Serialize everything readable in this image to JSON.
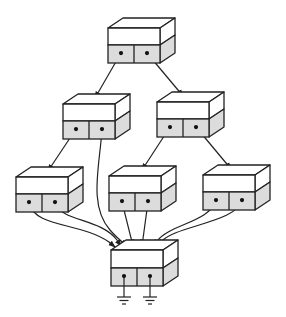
{
  "diagram": {
    "colors": {
      "stroke": "#222222",
      "port_fill": "#dcdcdc",
      "box_fill": "#ffffff"
    },
    "depth": {
      "dx": 15,
      "dy": -10
    },
    "nodes": [
      {
        "id": "root",
        "x": 108,
        "y": 28,
        "w": 52,
        "upper_h": 17,
        "lower_h": 18
      },
      {
        "id": "mid-left",
        "x": 63,
        "y": 104,
        "w": 52,
        "upper_h": 17,
        "lower_h": 18
      },
      {
        "id": "mid-right",
        "x": 157,
        "y": 102,
        "w": 52,
        "upper_h": 17,
        "lower_h": 18
      },
      {
        "id": "leaf-left",
        "x": 16,
        "y": 177,
        "w": 52,
        "upper_h": 17,
        "lower_h": 18
      },
      {
        "id": "leaf-middle",
        "x": 109,
        "y": 176,
        "w": 52,
        "upper_h": 17,
        "lower_h": 18
      },
      {
        "id": "leaf-right",
        "x": 203,
        "y": 175,
        "w": 52,
        "upper_h": 17,
        "lower_h": 18
      },
      {
        "id": "sink",
        "x": 111,
        "y": 250,
        "w": 52,
        "upper_h": 18,
        "lower_h": 18
      }
    ],
    "edges": [
      {
        "from": "root.p0",
        "to": "mid-left.top",
        "d": "M121,53 L95,98"
      },
      {
        "from": "root.p1",
        "to": "mid-right.top",
        "d": "M147,53 L183,96"
      },
      {
        "from": "mid-left.p0",
        "to": "leaf-left.top",
        "d": "M76,129 L48,171"
      },
      {
        "from": "mid-left.p1",
        "to": "sink",
        "d": "M102,129 C100,165 88,205 110,230 C116,237 122,242 127,246"
      },
      {
        "from": "mid-right.p0",
        "to": "leaf-middle.top",
        "d": "M170,127 L142,170"
      },
      {
        "from": "mid-right.p1",
        "to": "leaf-right.top",
        "d": "M196,127 L231,169"
      },
      {
        "from": "leaf-left.p0",
        "to": "sink",
        "d": "M29,203 C35,228 80,222 109,242 L115,247"
      },
      {
        "from": "leaf-left.p1",
        "to": "sink",
        "d": "M55,203 C62,222 100,218 117,240 L121,246"
      },
      {
        "from": "leaf-middle.p0",
        "to": "sink",
        "d": "M122,202 L133,246"
      },
      {
        "from": "leaf-middle.p1",
        "to": "sink",
        "d": "M148,202 L142,246"
      },
      {
        "from": "leaf-right.p0",
        "to": "sink",
        "d": "M216,200 C210,222 170,224 157,241 L154,246"
      },
      {
        "from": "leaf-right.p1",
        "to": "sink",
        "d": "M242,200 C238,222 175,226 162,241 L160,246"
      }
    ],
    "grounds": [
      {
        "x": 124,
        "y": 277
      },
      {
        "x": 150,
        "y": 277
      }
    ]
  }
}
